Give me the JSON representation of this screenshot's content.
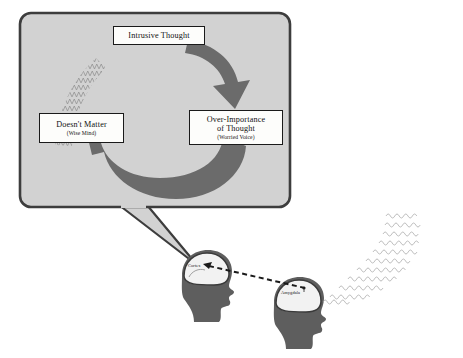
{
  "diagram": {
    "colors": {
      "page_background": "#ffffff",
      "bubble_fill": "#d2d2d2",
      "bubble_border": "#3d3d3d",
      "arrow_fill": "#6b6b6b",
      "head_fill": "#5e5e5e",
      "head_outline": "#3a3a3a",
      "box_fill": "#fdfdfb",
      "box_border": "#1a1a1a",
      "text": "#111111",
      "squiggle": "#9a9a9a",
      "dashed_line": "#1a1a1a"
    },
    "thought_bubble": {
      "name": "thought-bubble",
      "boxes": {
        "intrusive": {
          "main": "Intrusive Thought",
          "sub": ""
        },
        "over_importance": {
          "main": "Over-Importance",
          "main2": "of Thought",
          "sub": "(Worried Voice)"
        },
        "doesnt_matter": {
          "main": "Doesn't Matter",
          "sub": "(Wise Mind)"
        }
      },
      "arrows": [
        {
          "name": "arrow-intrusive-to-overimportance",
          "direction": "clockwise-top-right"
        },
        {
          "name": "arrow-overimportance-to-doesntmatter",
          "direction": "clockwise-bottom-left"
        }
      ],
      "squiggle_flow": {
        "name": "squiggle-into-doesnt-matter",
        "description": "zigzag wave band curving up-right from the Doesn't Matter box"
      }
    },
    "heads": [
      {
        "name": "head-cortex",
        "label": "Cortex",
        "facing": "right"
      },
      {
        "name": "head-amygdala",
        "label": "Amygdala",
        "facing": "right"
      }
    ],
    "connections": [
      {
        "name": "dashed-cortex-to-amygdala",
        "style": "dashed",
        "from": "Cortex",
        "to": "Amygdala"
      },
      {
        "name": "squiggle-into-amygdala",
        "style": "zigzag-waves",
        "from": "right edge",
        "to": "Amygdala"
      }
    ]
  }
}
